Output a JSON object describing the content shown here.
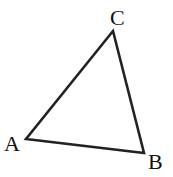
{
  "diagram": {
    "type": "triangle",
    "stroke_color": "#222222",
    "vertices": [
      {
        "name": "A",
        "x": 26,
        "y": 139,
        "label_x": 4,
        "label_y": 151
      },
      {
        "name": "B",
        "x": 144,
        "y": 153,
        "label_x": 148,
        "label_y": 169
      },
      {
        "name": "C",
        "x": 113,
        "y": 31,
        "label_x": 110,
        "label_y": 25
      }
    ],
    "labels": {
      "a": "A",
      "b": "B",
      "c": "C"
    }
  }
}
